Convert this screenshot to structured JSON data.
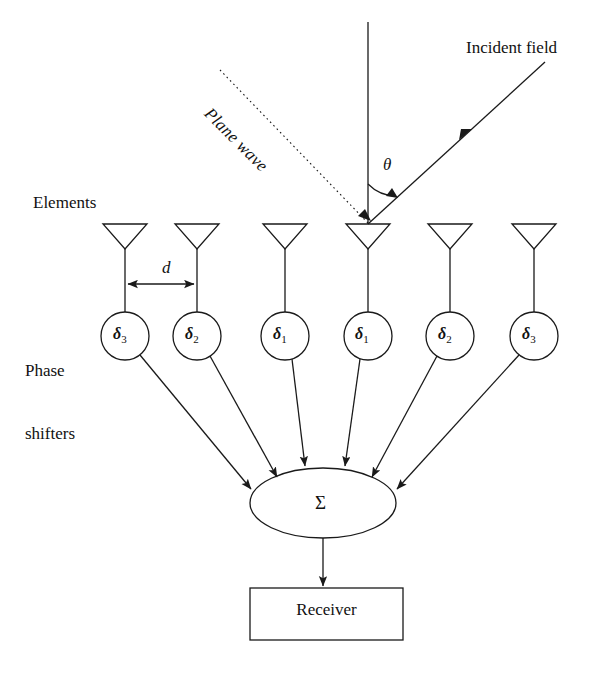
{
  "figure": {
    "type": "phased-array-antenna-block-diagram",
    "background_color": "#ffffff",
    "stroke_color": "#1a1a1a"
  },
  "labels": {
    "elements": "Elements",
    "phase_shifters_line1": "Phase",
    "phase_shifters_line2": "shifters",
    "incident_field": "Incident field",
    "plane_wave": "Plane wave",
    "spacing": "d",
    "angle": "θ",
    "summer": "Σ",
    "receiver": "Receiver"
  },
  "elements": [
    {
      "id": "el-1",
      "phase_label": "δ",
      "phase_sub": "3",
      "x": 125
    },
    {
      "id": "el-2",
      "phase_label": "δ",
      "phase_sub": "2",
      "x": 197
    },
    {
      "id": "el-3",
      "phase_label": "δ",
      "phase_sub": "1",
      "x": 285
    },
    {
      "id": "el-4",
      "phase_label": "δ",
      "phase_sub": "1",
      "x": 367
    },
    {
      "id": "el-5",
      "phase_label": "δ",
      "phase_sub": "2",
      "x": 450
    },
    {
      "id": "el-6",
      "phase_label": "δ",
      "phase_sub": "3",
      "x": 534
    }
  ],
  "geometry": {
    "antenna_top_y": 224,
    "antenna_apex_y": 249,
    "antenna_half_width": 22,
    "circle_center_y": 336,
    "circle_radius": 24,
    "summer_center_x": 323,
    "summer_center_y": 503,
    "summer_rx": 73,
    "summer_ry": 35,
    "receiver_box": {
      "x": 250,
      "y": 588,
      "width": 153,
      "height": 52
    },
    "normal_line": {
      "x": 368,
      "y_top": 22,
      "y_bottom": 224
    },
    "incident_ray": {
      "x1": 545,
      "y1": 62,
      "x2": 368,
      "y2": 224
    },
    "plane_wave_line": {
      "x1": 220,
      "y1": 70,
      "x2": 368,
      "y2": 223
    },
    "angle_arc_radius": 40
  }
}
